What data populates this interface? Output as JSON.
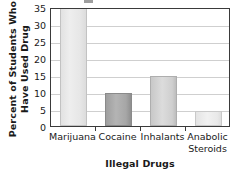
{
  "chart_data": {
    "type": "bar",
    "title": "",
    "categories": [
      "Marijuana",
      "Cocaine",
      "Inhalants",
      "Anabolic Steroids"
    ],
    "category_lines": [
      [
        "Marijuana"
      ],
      [
        "Cocaine"
      ],
      [
        "Inhalants"
      ],
      [
        "Anabolic",
        "Steroids"
      ]
    ],
    "values": [
      35,
      9.7,
      14.8,
      4.3
    ],
    "xlabel": "Illegal Drugs",
    "ylabel": "Percent of Students Who Have Used Drug",
    "ylabel_lines": [
      "Percent of Students Who",
      "Have Used Drug"
    ],
    "ylim": [
      0,
      35
    ],
    "yticks": [
      0,
      5,
      10,
      15,
      20,
      25,
      30,
      35
    ],
    "ytick_labels": [
      "0",
      "5",
      "10",
      "15",
      "20",
      "25",
      "30",
      "35"
    ],
    "grid": "horizontal",
    "legend": "none",
    "bar_colors": [
      "#e7e7e7",
      "#a6a6a6",
      "#cfcfcf",
      "#e9e9e9"
    ],
    "axis_color": "#3a3a3a",
    "gridline_color": "#cfcfcf",
    "text_color": "#1a1a1a"
  }
}
